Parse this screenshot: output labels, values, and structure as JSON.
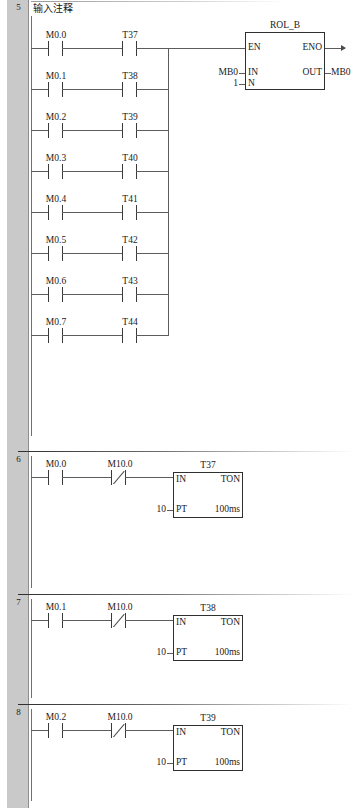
{
  "editor": {
    "name": "ladder-logic-editor",
    "language": "LAD"
  },
  "networks": [
    {
      "number": "5",
      "comment": "输入注释",
      "rungs": [
        {
          "contacts": [
            {
              "label": "M0.0",
              "type": "NO"
            },
            {
              "label": "T37",
              "type": "NO"
            }
          ]
        },
        {
          "contacts": [
            {
              "label": "M0.1",
              "type": "NO"
            },
            {
              "label": "T38",
              "type": "NO"
            }
          ]
        },
        {
          "contacts": [
            {
              "label": "M0.2",
              "type": "NO"
            },
            {
              "label": "T39",
              "type": "NO"
            }
          ]
        },
        {
          "contacts": [
            {
              "label": "M0.3",
              "type": "NO"
            },
            {
              "label": "T40",
              "type": "NO"
            }
          ]
        },
        {
          "contacts": [
            {
              "label": "M0.4",
              "type": "NO"
            },
            {
              "label": "T41",
              "type": "NO"
            }
          ]
        },
        {
          "contacts": [
            {
              "label": "M0.5",
              "type": "NO"
            },
            {
              "label": "T42",
              "type": "NO"
            }
          ]
        },
        {
          "contacts": [
            {
              "label": "M0.6",
              "type": "NO"
            },
            {
              "label": "T43",
              "type": "NO"
            }
          ]
        },
        {
          "contacts": [
            {
              "label": "M0.7",
              "type": "NO"
            },
            {
              "label": "T44",
              "type": "NO"
            }
          ]
        }
      ],
      "block": {
        "type": "ROL_B",
        "title": "ROL_B",
        "pin_en": "EN",
        "pin_eno": "ENO",
        "pin_in": "IN",
        "pin_n": "N",
        "pin_out": "OUT",
        "in_value": "MB0",
        "n_value": "1",
        "out_value": "MB0"
      }
    },
    {
      "number": "6",
      "contacts": [
        {
          "label": "M0.0",
          "type": "NO"
        },
        {
          "label": "M10.0",
          "type": "NC"
        }
      ],
      "timer": {
        "instance": "T37",
        "type": "TON",
        "pin_in": "IN",
        "pin_pt": "PT",
        "preset": "10",
        "timebase": "100ms"
      }
    },
    {
      "number": "7",
      "contacts": [
        {
          "label": "M0.1",
          "type": "NO"
        },
        {
          "label": "M10.0",
          "type": "NC"
        }
      ],
      "timer": {
        "instance": "T38",
        "type": "TON",
        "pin_in": "IN",
        "pin_pt": "PT",
        "preset": "10",
        "timebase": "100ms"
      }
    },
    {
      "number": "8",
      "contacts": [
        {
          "label": "M0.2",
          "type": "NO"
        },
        {
          "label": "M10.0",
          "type": "NC"
        }
      ],
      "timer": {
        "instance": "T39",
        "type": "TON",
        "pin_in": "IN",
        "pin_pt": "PT",
        "preset": "10",
        "timebase": "100ms"
      }
    }
  ]
}
